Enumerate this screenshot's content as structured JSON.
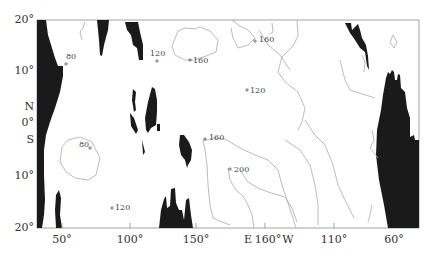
{
  "map": {
    "type": "contour-map",
    "frame": {
      "left": 37,
      "top": 20,
      "right": 419,
      "bottom": 228
    },
    "colors": {
      "land": "#1a1a1a",
      "contour": "#a8a8a8",
      "frame": "#888888",
      "text": "#333333"
    }
  },
  "y_axis": {
    "labels": [
      {
        "text": "20°",
        "y": 20
      },
      {
        "text": "10°",
        "y": 71
      },
      {
        "text": "N",
        "y": 107
      },
      {
        "text": "0°",
        "y": 123
      },
      {
        "text": "S",
        "y": 140
      },
      {
        "text": "10°",
        "y": 176
      },
      {
        "text": "20°",
        "y": 228
      }
    ]
  },
  "x_axis": {
    "labels": [
      {
        "text": "50°",
        "x": 62
      },
      {
        "text": "100°",
        "x": 130
      },
      {
        "text": "150°",
        "x": 196
      },
      {
        "text": "E",
        "x": 248
      },
      {
        "text": "160°",
        "x": 268
      },
      {
        "text": "W",
        "x": 287
      },
      {
        "text": "110°",
        "x": 334
      },
      {
        "text": "60°",
        "x": 394
      }
    ]
  },
  "contour_labels": [
    {
      "text": "80",
      "x": 66,
      "y": 60
    },
    {
      "text": "120",
      "x": 153,
      "y": 57
    },
    {
      "text": "160",
      "x": 194,
      "y": 63
    },
    {
      "text": "160",
      "x": 259,
      "y": 42
    },
    {
      "text": "120",
      "x": 251,
      "y": 93
    },
    {
      "text": "80",
      "x": 80,
      "y": 147
    },
    {
      "text": "160",
      "x": 210,
      "y": 139
    },
    {
      "text": "200",
      "x": 235,
      "y": 172
    },
    {
      "text": "120",
      "x": 115,
      "y": 209
    }
  ]
}
